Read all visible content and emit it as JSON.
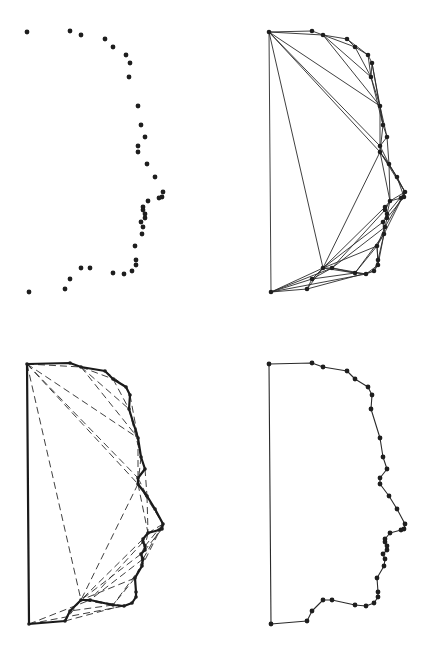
{
  "figure": {
    "panels": [
      {
        "id": "point-set",
        "position": "top-left",
        "offset": [
          0,
          0
        ],
        "style": "points"
      },
      {
        "id": "triangulation",
        "position": "top-right",
        "offset": [
          242,
          0
        ],
        "style": "triangulation"
      },
      {
        "id": "contour-with-candidate-edges",
        "position": "bottom-left",
        "offset": [
          0,
          332
        ],
        "style": "contour-dashed"
      },
      {
        "id": "reconstructed-contour",
        "position": "bottom-right",
        "offset": [
          242,
          332
        ],
        "style": "contour"
      }
    ],
    "colors": {
      "ink": "#1e1e1e",
      "background": "#ffffff"
    }
  },
  "points": [
    [
      27,
      32
    ],
    [
      70,
      31
    ],
    [
      81,
      35
    ],
    [
      105,
      39
    ],
    [
      113,
      47
    ],
    [
      126,
      55
    ],
    [
      130,
      63
    ],
    [
      129,
      77
    ],
    [
      138,
      106
    ],
    [
      141,
      125
    ],
    [
      145,
      137
    ],
    [
      138,
      146
    ],
    [
      138,
      152
    ],
    [
      147,
      164
    ],
    [
      155,
      177
    ],
    [
      163,
      192
    ],
    [
      162,
      197
    ],
    [
      159,
      198
    ],
    [
      148,
      201
    ],
    [
      143,
      207
    ],
    [
      143,
      210
    ],
    [
      145,
      214
    ],
    [
      145,
      218
    ],
    [
      141,
      222
    ],
    [
      143,
      227
    ],
    [
      142,
      234
    ],
    [
      135,
      246
    ],
    [
      136,
      260
    ],
    [
      136,
      265
    ],
    [
      132,
      271
    ],
    [
      124,
      274
    ],
    [
      113,
      273
    ],
    [
      90,
      268
    ],
    [
      81,
      268
    ],
    [
      70,
      279
    ],
    [
      65,
      289
    ],
    [
      29,
      292
    ]
  ],
  "triangulation_edges": [
    [
      0,
      1
    ],
    [
      1,
      2
    ],
    [
      2,
      3
    ],
    [
      3,
      4
    ],
    [
      4,
      5
    ],
    [
      5,
      6
    ],
    [
      6,
      7
    ],
    [
      7,
      8
    ],
    [
      8,
      9
    ],
    [
      9,
      10
    ],
    [
      10,
      11
    ],
    [
      11,
      12
    ],
    [
      12,
      13
    ],
    [
      13,
      14
    ],
    [
      14,
      15
    ],
    [
      15,
      16
    ],
    [
      16,
      17
    ],
    [
      17,
      18
    ],
    [
      18,
      19
    ],
    [
      19,
      20
    ],
    [
      20,
      21
    ],
    [
      21,
      22
    ],
    [
      22,
      23
    ],
    [
      23,
      24
    ],
    [
      24,
      25
    ],
    [
      25,
      26
    ],
    [
      26,
      27
    ],
    [
      27,
      28
    ],
    [
      28,
      29
    ],
    [
      29,
      30
    ],
    [
      30,
      31
    ],
    [
      31,
      32
    ],
    [
      32,
      33
    ],
    [
      33,
      34
    ],
    [
      34,
      35
    ],
    [
      35,
      36
    ],
    [
      36,
      0
    ],
    [
      0,
      2
    ],
    [
      0,
      8
    ],
    [
      0,
      11
    ],
    [
      0,
      12
    ],
    [
      0,
      33
    ],
    [
      2,
      4
    ],
    [
      2,
      7
    ],
    [
      2,
      8
    ],
    [
      3,
      5
    ],
    [
      4,
      7
    ],
    [
      5,
      7
    ],
    [
      6,
      8
    ],
    [
      7,
      9
    ],
    [
      8,
      10
    ],
    [
      8,
      11
    ],
    [
      6,
      9
    ],
    [
      9,
      12
    ],
    [
      10,
      13
    ],
    [
      11,
      13
    ],
    [
      12,
      14
    ],
    [
      13,
      15
    ],
    [
      12,
      15
    ],
    [
      14,
      16
    ],
    [
      15,
      17
    ],
    [
      15,
      18
    ],
    [
      13,
      18
    ],
    [
      12,
      18
    ],
    [
      12,
      33
    ],
    [
      18,
      20
    ],
    [
      18,
      21
    ],
    [
      15,
      21
    ],
    [
      16,
      22
    ],
    [
      21,
      23
    ],
    [
      22,
      24
    ],
    [
      15,
      24
    ],
    [
      15,
      25
    ],
    [
      23,
      25
    ],
    [
      24,
      26
    ],
    [
      25,
      27
    ],
    [
      26,
      28
    ],
    [
      25,
      28
    ],
    [
      27,
      29
    ],
    [
      28,
      30
    ],
    [
      26,
      31
    ],
    [
      25,
      31
    ],
    [
      24,
      32
    ],
    [
      23,
      33
    ],
    [
      19,
      33
    ],
    [
      20,
      32
    ],
    [
      26,
      33
    ],
    [
      31,
      33
    ],
    [
      30,
      32
    ],
    [
      32,
      34
    ],
    [
      33,
      35
    ],
    [
      31,
      34
    ],
    [
      35,
      29
    ],
    [
      36,
      34
    ],
    [
      36,
      32
    ],
    [
      33,
      36
    ],
    [
      36,
      30
    ]
  ],
  "dashed_edges": [
    [
      0,
      2
    ],
    [
      0,
      8
    ],
    [
      0,
      11
    ],
    [
      0,
      12
    ],
    [
      0,
      33
    ],
    [
      2,
      4
    ],
    [
      2,
      7
    ],
    [
      2,
      8
    ],
    [
      3,
      5
    ],
    [
      4,
      7
    ],
    [
      6,
      8
    ],
    [
      7,
      9
    ],
    [
      8,
      11
    ],
    [
      9,
      12
    ],
    [
      10,
      13
    ],
    [
      11,
      13
    ],
    [
      12,
      14
    ],
    [
      13,
      15
    ],
    [
      12,
      15
    ],
    [
      15,
      17
    ],
    [
      15,
      18
    ],
    [
      13,
      18
    ],
    [
      12,
      18
    ],
    [
      12,
      33
    ],
    [
      18,
      21
    ],
    [
      15,
      21
    ],
    [
      16,
      22
    ],
    [
      21,
      23
    ],
    [
      15,
      24
    ],
    [
      15,
      25
    ],
    [
      23,
      25
    ],
    [
      24,
      26
    ],
    [
      26,
      28
    ],
    [
      26,
      31
    ],
    [
      25,
      31
    ],
    [
      24,
      32
    ],
    [
      23,
      33
    ],
    [
      19,
      33
    ],
    [
      20,
      32
    ],
    [
      26,
      33
    ],
    [
      31,
      33
    ],
    [
      30,
      32
    ],
    [
      33,
      35
    ],
    [
      31,
      34
    ],
    [
      36,
      32
    ],
    [
      36,
      30
    ],
    [
      35,
      29
    ]
  ],
  "contour_order": [
    0,
    1,
    2,
    3,
    4,
    5,
    6,
    7,
    8,
    9,
    10,
    11,
    12,
    13,
    14,
    15,
    16,
    17,
    18,
    19,
    20,
    21,
    22,
    23,
    24,
    25,
    26,
    27,
    28,
    29,
    30,
    31,
    32,
    33,
    34,
    35,
    36,
    0
  ]
}
